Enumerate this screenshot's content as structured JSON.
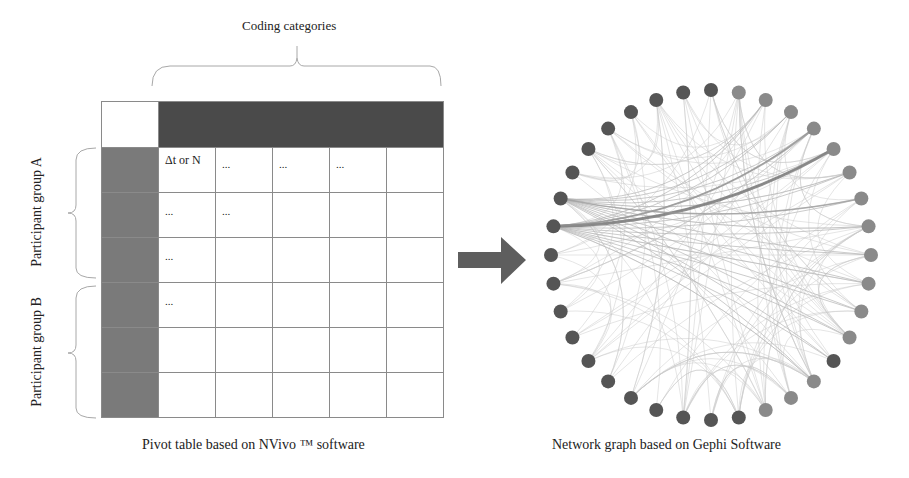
{
  "pivot_panel": {
    "column_label": "Coding categories",
    "row_groups": [
      {
        "label": "Participant group A"
      },
      {
        "label": "Participant group B"
      }
    ],
    "rows": [
      [
        "Δt or N",
        "...",
        "...",
        "...",
        ""
      ],
      [
        "...",
        "...",
        "",
        "",
        ""
      ],
      [
        "...",
        "",
        "",
        "",
        ""
      ],
      [
        "...",
        "",
        "",
        "",
        ""
      ],
      [
        "",
        "",
        "",
        "",
        ""
      ],
      [
        "",
        "",
        "",
        "",
        ""
      ]
    ],
    "caption": "Pivot table based on NVivo ™ software"
  },
  "arrow": {
    "icon": "right-arrow-icon",
    "color": "#5a5a5a"
  },
  "network_panel": {
    "caption": "Network graph based on Gephi Software",
    "node_count": 36,
    "colors": {
      "dark_node": "#555555",
      "light_node": "#8a8a8a",
      "edge": "#c8c8c8",
      "strong_edge": "#7a7a7a"
    }
  }
}
